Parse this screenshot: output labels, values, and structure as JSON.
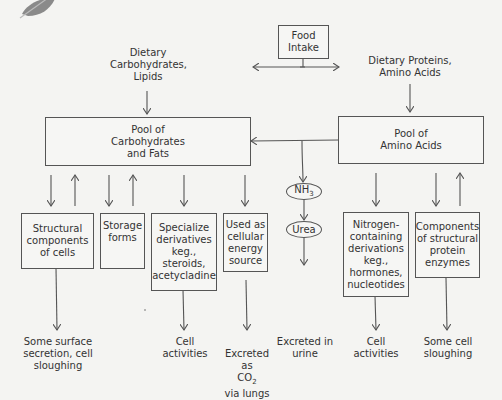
{
  "diagram": {
    "food_intake": "Food\nIntake",
    "dietary_carbs": "Dietary\nCarbohydrates,\nLipids",
    "dietary_proteins": "Dietary Proteins,\nAmino Acids",
    "pool_carbs": "Pool of\nCarbohydrates\nand Fats",
    "pool_amino": "Pool of\nAmino Acids",
    "nh3": "NH",
    "nh3_sub": "3",
    "urea": "Urea",
    "boxes": {
      "structural": "Structural\ncomponents\nof cells",
      "storage": "Storage\nforms",
      "specialize": "Specialize\nderivatives\nkeg.,\nsteroids,\nacetycladine",
      "energy": "Used as\ncellular\nenergy\nsource",
      "nitrogen": "Nitrogen-\ncontaining\nderivations\nkeg.,\nhormones,\nnucleotides",
      "components": "Components\nof structural\nprotein\nenzymes"
    },
    "outcomes": {
      "surface": "Some surface\nsecretion, cell\nsloughing",
      "cell_act_1": "Cell\nactivities",
      "co2_a": "Excreted as",
      "co2_b": "CO",
      "co2_sub": "2",
      "co2_c": "via lungs",
      "urine": "Excreted in\nurine",
      "cell_act_2": "Cell\nactivities",
      "sloughing": "Some cell\nsloughing"
    },
    "colors": {
      "line": "#555555",
      "background": "#f4f4f2",
      "leaf": "#8a8a8a"
    }
  }
}
